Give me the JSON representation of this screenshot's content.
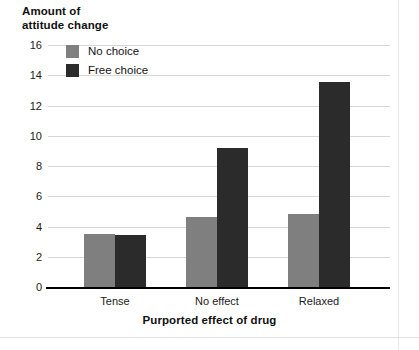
{
  "figure": {
    "y_axis_title": "Amount of\nattitude change",
    "x_axis_title": "Purported effect of drug"
  },
  "legend": {
    "position": "top-left-inside",
    "entries": [
      {
        "label": "No choice",
        "color": "#7f7f7f",
        "swatch_name": "legend-swatch-no-choice"
      },
      {
        "label": "Free choice",
        "color": "#2b2b2b",
        "swatch_name": "legend-swatch-free-choice"
      }
    ]
  },
  "axes": {
    "y_ticks": [
      "16",
      "14",
      "12",
      "10",
      "8",
      "6",
      "4",
      "2",
      "0"
    ],
    "x_ticks": [
      "Tense",
      "No effect",
      "Relaxed"
    ]
  },
  "chart_data": {
    "type": "bar",
    "title": "",
    "xlabel": "Purported effect of drug",
    "ylabel": "Amount of attitude change",
    "categories": [
      "Tense",
      "No effect",
      "Relaxed"
    ],
    "series": [
      {
        "name": "No choice",
        "color": "#7f7f7f",
        "values": [
          3.5,
          4.6,
          4.8
        ]
      },
      {
        "name": "Free choice",
        "color": "#2b2b2b",
        "values": [
          3.45,
          9.2,
          13.55
        ]
      }
    ],
    "ylim": [
      0,
      16
    ],
    "ytick_values": [
      0,
      2,
      4,
      6,
      8,
      10,
      12,
      14,
      16
    ],
    "grid": "horizontal",
    "legend_position": "upper left"
  }
}
